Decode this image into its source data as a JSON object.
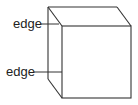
{
  "diagram": {
    "type": "cube-wireframe",
    "stroke_color": "#333333",
    "labels": [
      {
        "id": "top-edge-label",
        "text": "edge"
      },
      {
        "id": "bottom-edge-label",
        "text": "edge"
      }
    ]
  }
}
